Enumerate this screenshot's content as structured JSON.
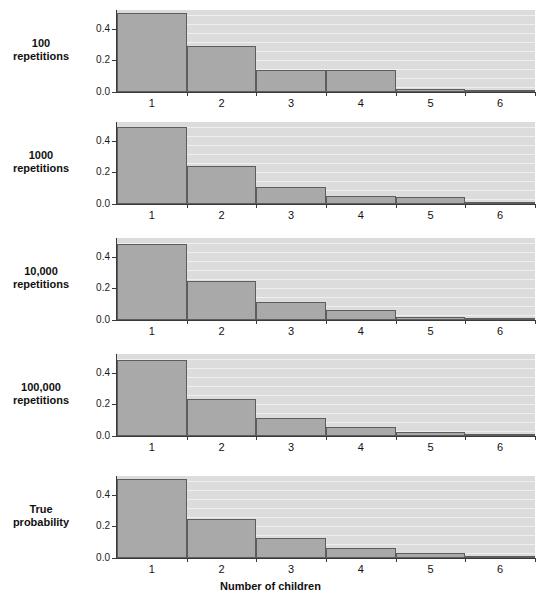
{
  "figure": {
    "xaxis_title": "Number of children",
    "ytick_labels": [
      "0.4",
      "0.2",
      "0.0"
    ],
    "ytick_values": [
      0.4,
      0.2,
      0.0
    ],
    "xtick_labels": [
      "1",
      "2",
      "3",
      "4",
      "5",
      "6"
    ],
    "panel_labels": [
      "100\nrepetitions",
      "1000\nrepetitions",
      "10,000\nrepetitions",
      "100,000\nrepetitions",
      "True\nprobability"
    ],
    "panel_labels_line1": [
      "100",
      "1000",
      "10,000",
      "100,000",
      "True"
    ],
    "panel_labels_line2": [
      "repetitions",
      "repetitions",
      "repetitions",
      "repetitions",
      "probability"
    ],
    "colors": {
      "bar_fill": "#a9a9a9",
      "bar_edge": "#5d5d5d",
      "plot_background": "#dcdcdc",
      "page_background": "#ffffff",
      "axis": "#3a3a3a",
      "text": "#111111"
    }
  },
  "chart_data": {
    "type": "bar",
    "title": "",
    "subtitle": "",
    "xlabel": "Number of children",
    "ylabel": "",
    "categories": [
      "1",
      "2",
      "3",
      "4",
      "5",
      "6"
    ],
    "ylim": [
      0.0,
      0.52
    ],
    "yticks": [
      0.0,
      0.2,
      0.4
    ],
    "grid": false,
    "legend": "none",
    "panel_layout": "5 stacked panels sharing the x axis",
    "series": [
      {
        "name": "100 repetitions",
        "values": [
          0.5,
          0.29,
          0.14,
          0.14,
          0.02,
          0.01
        ]
      },
      {
        "name": "1000 repetitions",
        "values": [
          0.49,
          0.24,
          0.11,
          0.05,
          0.045,
          0.01
        ]
      },
      {
        "name": "10,000 repetitions",
        "values": [
          0.48,
          0.245,
          0.115,
          0.065,
          0.02,
          0.005
        ]
      },
      {
        "name": "100,000 repetitions",
        "values": [
          0.485,
          0.235,
          0.115,
          0.055,
          0.025,
          0.008
        ]
      },
      {
        "name": "True probability",
        "values": [
          0.5,
          0.25,
          0.125,
          0.0625,
          0.03125,
          0.015625
        ]
      }
    ]
  }
}
